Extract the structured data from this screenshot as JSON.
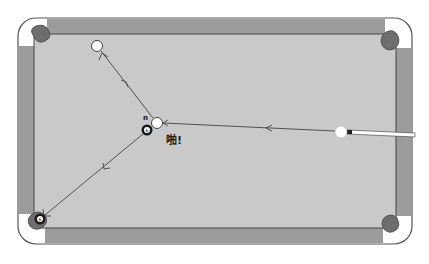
{
  "diagram": {
    "colors": {
      "background": "#ffffff",
      "frame_outline": "#555555",
      "rail": "#9c9c9c",
      "felt": "#c9c9c9",
      "pocket": "#6e6e6e",
      "corner": "#ffffff",
      "path": "#444444",
      "cue_ball": "#ffffff",
      "object_ball": "#1a1a1a",
      "cue_stick": "#ffffff",
      "cue_tip": "#222222"
    },
    "table": {
      "x": 18,
      "y": 18,
      "width": 394,
      "height": 226
    },
    "balls": [
      {
        "name": "cue-ball-start",
        "x": 341,
        "y": 131,
        "r": 6,
        "type": "cue"
      },
      {
        "name": "cue-ball-contact",
        "x": 157,
        "y": 123,
        "r": 6,
        "type": "cue"
      },
      {
        "name": "cue-ball-final",
        "x": 97,
        "y": 46,
        "r": 6,
        "type": "cue"
      },
      {
        "name": "object-ball-start",
        "x": 147,
        "y": 130,
        "r": 6,
        "type": "object",
        "label": "6"
      },
      {
        "name": "object-ball-pocketed",
        "x": 40,
        "y": 220,
        "r": 6,
        "type": "object",
        "label": "6"
      }
    ],
    "labels": {
      "ball_number_tag": "n",
      "impact_text": "啪!"
    }
  }
}
